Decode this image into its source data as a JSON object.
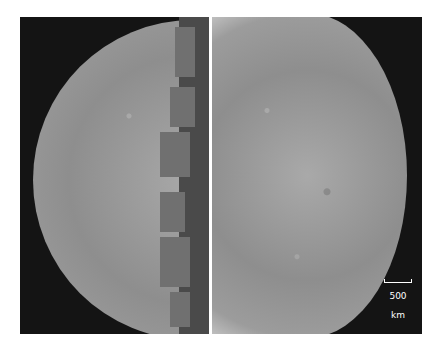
{
  "figure": {
    "panels": [
      {
        "name": "left-hemisphere",
        "background": "#141414"
      },
      {
        "name": "right-hemisphere",
        "background": "#141414"
      }
    ],
    "scale_bar": {
      "label": "500 km",
      "color": "#ffffff"
    }
  }
}
